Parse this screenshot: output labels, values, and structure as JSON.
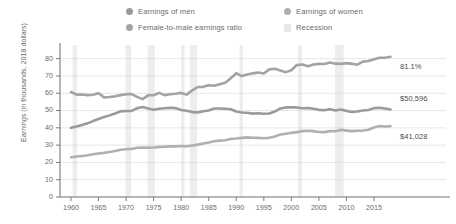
{
  "legend": {
    "items": [
      {
        "label": "Earnings of men",
        "color": "#9a9a9a",
        "marker": "circle",
        "name": "legend-earnings-of-men"
      },
      {
        "label": "Earnings of women",
        "color": "#b0b0b0",
        "marker": "circle",
        "name": "legend-earnings-of-women"
      },
      {
        "label": "Female-to-male earnings ratio",
        "color": "#a3a3a3",
        "marker": "circle",
        "name": "legend-earnings-ratio"
      },
      {
        "label": "Recession",
        "color": "#e8e8e8",
        "marker": "square",
        "name": "legend-recession"
      }
    ]
  },
  "axes": {
    "ylabel": "Earnings (in thousands, 2018 dollars)",
    "xlabel": "",
    "yticks": [
      "0",
      "10",
      "20",
      "30",
      "40",
      "50",
      "60",
      "70",
      "80"
    ],
    "xticks": [
      "1960",
      "1965",
      "1970",
      "1975",
      "1980",
      "1985",
      "1990",
      "1995",
      "2000",
      "2005",
      "2010",
      "2015"
    ]
  },
  "annotations": [
    {
      "text": "81.1%",
      "name": "annotation-ratio-value",
      "series": "ratio"
    },
    {
      "text": "$50,596",
      "name": "annotation-men-value",
      "series": "men"
    },
    {
      "text": "$41,028",
      "name": "annotation-women-value",
      "series": "women"
    }
  ],
  "chart_data": {
    "type": "line",
    "title": "",
    "xlabel": "",
    "ylabel": "Earnings (in thousands, 2018 dollars)",
    "xlim": [
      1958,
      2019
    ],
    "ylim": [
      0,
      85
    ],
    "grid": true,
    "legend_position": "top",
    "x": [
      1960,
      1961,
      1962,
      1963,
      1964,
      1965,
      1966,
      1967,
      1968,
      1969,
      1970,
      1971,
      1972,
      1973,
      1974,
      1975,
      1976,
      1977,
      1978,
      1979,
      1980,
      1981,
      1982,
      1983,
      1984,
      1985,
      1986,
      1987,
      1988,
      1989,
      1990,
      1991,
      1992,
      1993,
      1994,
      1995,
      1996,
      1997,
      1998,
      1999,
      2000,
      2001,
      2002,
      2003,
      2004,
      2005,
      2006,
      2007,
      2008,
      2009,
      2010,
      2011,
      2012,
      2013,
      2014,
      2015,
      2016,
      2017,
      2018
    ],
    "series": [
      {
        "name": "Earnings of men",
        "color": "#9a9a9a",
        "unit": "thousands of 2018 dollars",
        "end_label": "$50,596",
        "values": [
          40.0,
          40.8,
          41.6,
          42.6,
          43.9,
          45.1,
          46.2,
          47.2,
          48.3,
          49.5,
          49.7,
          49.8,
          51.3,
          52.0,
          51.2,
          50.5,
          51.0,
          51.3,
          51.6,
          51.4,
          50.3,
          49.9,
          49.1,
          48.9,
          49.6,
          50.0,
          51.2,
          51.2,
          51.0,
          50.7,
          49.4,
          48.9,
          48.7,
          48.2,
          48.4,
          48.1,
          48.3,
          49.4,
          51.2,
          51.8,
          51.9,
          51.8,
          51.3,
          51.5,
          51.0,
          50.4,
          50.2,
          50.8,
          50.0,
          50.6,
          49.8,
          49.2,
          49.4,
          50.0,
          50.3,
          51.4,
          51.6,
          51.2,
          50.6
        ]
      },
      {
        "name": "Earnings of women",
        "color": "#b0b0b0",
        "unit": "thousands of 2018 dollars",
        "end_label": "$41,028",
        "values": [
          23.0,
          23.4,
          23.7,
          24.1,
          24.7,
          25.2,
          25.5,
          26.0,
          26.6,
          27.3,
          27.6,
          27.8,
          28.5,
          28.6,
          28.5,
          28.6,
          29.0,
          29.1,
          29.3,
          29.3,
          29.5,
          29.3,
          29.8,
          30.3,
          30.9,
          31.5,
          32.2,
          32.6,
          32.8,
          33.6,
          33.8,
          34.2,
          34.5,
          34.3,
          34.2,
          34.0,
          34.2,
          35.0,
          36.1,
          36.6,
          37.1,
          37.5,
          38.1,
          38.3,
          38.1,
          37.6,
          37.5,
          38.1,
          38.0,
          38.8,
          38.4,
          38.1,
          38.3,
          38.4,
          38.9,
          40.2,
          41.0,
          40.8,
          41.0
        ]
      },
      {
        "name": "Female-to-male earnings ratio",
        "color": "#a3a3a3",
        "unit": "percent",
        "end_label": "81.1%",
        "values": [
          60.7,
          59.2,
          59.3,
          58.9,
          59.1,
          60.0,
          57.6,
          57.8,
          58.2,
          58.9,
          59.4,
          59.5,
          57.9,
          56.6,
          58.8,
          58.8,
          60.2,
          58.9,
          59.4,
          59.7,
          60.2,
          59.2,
          61.7,
          63.6,
          63.7,
          64.6,
          64.3,
          65.2,
          66.0,
          68.7,
          71.6,
          69.9,
          70.8,
          71.5,
          72.0,
          71.4,
          73.8,
          74.2,
          73.2,
          72.2,
          73.3,
          76.3,
          76.6,
          75.6,
          76.6,
          77.0,
          76.9,
          77.8,
          77.1,
          77.0,
          77.4,
          77.0,
          76.5,
          78.3,
          78.6,
          79.6,
          80.5,
          80.5,
          81.1
        ]
      }
    ],
    "recessions": [
      {
        "start": 1960.3,
        "end": 1961.1
      },
      {
        "start": 1969.9,
        "end": 1970.9
      },
      {
        "start": 1973.9,
        "end": 1975.2
      },
      {
        "start": 1980.0,
        "end": 1980.6
      },
      {
        "start": 1981.6,
        "end": 1982.9
      },
      {
        "start": 1990.6,
        "end": 1991.2
      },
      {
        "start": 2001.2,
        "end": 2001.9
      },
      {
        "start": 2007.9,
        "end": 2009.5
      }
    ]
  }
}
